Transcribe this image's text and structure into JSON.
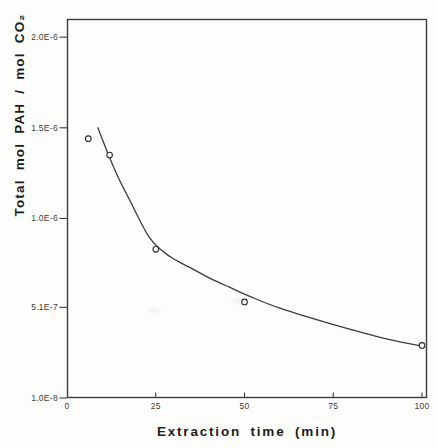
{
  "figure": {
    "background": "#fdfdfb",
    "ink_color": "#3c3c3c"
  },
  "chart_data": {
    "type": "scatter",
    "title": "",
    "xlabel": "Extraction time (min)",
    "ylabel": "Total mol PAH / mol CO₂",
    "xlim": [
      0,
      101.4
    ],
    "ylim": [
      1e-08,
      2.1e-06
    ],
    "grid": false,
    "legend": null,
    "marker": "open-circle",
    "frame": "full-box",
    "x_ticks": [
      {
        "value": 0,
        "label": "0"
      },
      {
        "value": 25,
        "label": "25"
      },
      {
        "value": 50,
        "label": "50"
      },
      {
        "value": 75,
        "label": "75"
      },
      {
        "value": 100,
        "label": "100"
      }
    ],
    "y_ticks": [
      {
        "value": 2e-06,
        "label": "2.0E-6"
      },
      {
        "value": 1.5e-06,
        "label": "1.5E-6"
      },
      {
        "value": 1e-06,
        "label": "1.0E-6"
      },
      {
        "value": 5.1e-07,
        "label": "5.1E-7"
      },
      {
        "value": 1e-08,
        "label": "1.0E-8"
      }
    ],
    "points": [
      {
        "x": 6,
        "y": 1.44e-06
      },
      {
        "x": 12,
        "y": 1.35e-06
      },
      {
        "x": 25,
        "y": 8.3e-07
      },
      {
        "x": 50,
        "y": 5.4e-07
      },
      {
        "x": 100,
        "y": 3e-07
      }
    ],
    "fit_curve": [
      {
        "x": 8.7,
        "y": 1.5e-06
      },
      {
        "x": 11.3,
        "y": 1.37e-06
      },
      {
        "x": 14.1,
        "y": 1.24e-06
      },
      {
        "x": 17.7,
        "y": 1.1e-06
      },
      {
        "x": 23.4,
        "y": 8.9e-07
      },
      {
        "x": 29.0,
        "y": 7.9e-07
      },
      {
        "x": 34.6,
        "y": 7.3e-07
      },
      {
        "x": 40.3,
        "y": 6.7e-07
      },
      {
        "x": 45.9,
        "y": 6.2e-07
      },
      {
        "x": 51.5,
        "y": 5.7e-07
      },
      {
        "x": 60.0,
        "y": 5.05e-07
      },
      {
        "x": 74.1,
        "y": 4.2e-07
      },
      {
        "x": 88.2,
        "y": 3.45e-07
      },
      {
        "x": 100,
        "y": 2.95e-07
      }
    ],
    "stroke_color": "#3c3c3c",
    "point_stroke_color": "#2e2e2e",
    "point_fill_color": "#fdfdfb"
  }
}
